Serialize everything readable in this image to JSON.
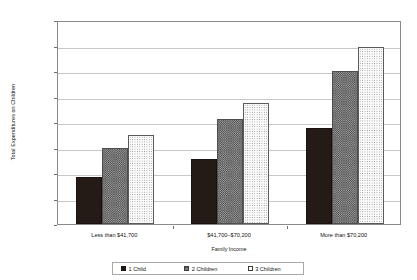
{
  "chart_data": {
    "type": "bar",
    "title": "",
    "xlabel": "Family Income",
    "ylabel": "Total Expenditures on Children",
    "categories": [
      "Less than $41,700",
      "$41,700–$70,200",
      "More than $70,200"
    ],
    "series": [
      {
        "name": "1 Child",
        "values": [
          9300,
          12800,
          18800
        ]
      },
      {
        "name": "2 Children",
        "values": [
          15000,
          20500,
          30000
        ]
      },
      {
        "name": "3 Children",
        "values": [
          17500,
          23800,
          34700
        ]
      }
    ],
    "ylim": [
      0,
      40000
    ],
    "ytick_values": [
      0,
      5000,
      10000,
      15000,
      20000,
      25000,
      30000,
      35000,
      40000
    ],
    "ytick_labels": [
      "$0",
      "$5,000",
      "$10,000",
      "$15,000",
      "$20,000",
      "$25,000",
      "$30,000",
      "$35,000",
      "$40,000"
    ],
    "grid": true,
    "legend_position": "bottom",
    "legend_entries": [
      "1 Child",
      "2 Children",
      "3 Children"
    ],
    "bar_styles": [
      "solid-black",
      "gray-crosshatch",
      "white-dotted"
    ],
    "colors": {
      "series_1": "#241a16",
      "series_2": "#9a9a9a",
      "series_3": "#fbfbfb",
      "gridline": "#c8c8c8",
      "axis": "#8a8a8a",
      "text": "#141414",
      "background": "#ffffff"
    }
  }
}
